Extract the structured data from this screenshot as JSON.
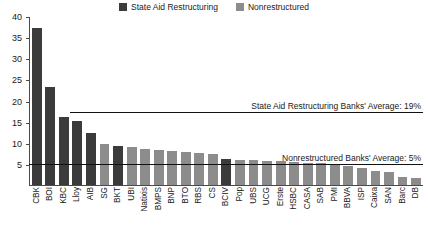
{
  "chart_data": {
    "type": "bar",
    "title": "",
    "xlabel": "",
    "ylabel": "",
    "ylim": [
      0,
      40
    ],
    "yticks": [
      0,
      5,
      10,
      15,
      20,
      25,
      30,
      35,
      40
    ],
    "ytick_labels": [
      "",
      "5",
      "10",
      "15",
      "20",
      "25",
      "30",
      "35",
      "40"
    ],
    "grid": false,
    "legend_position": "top-center",
    "categories": [
      "CBK",
      "BOI",
      "KBC",
      "Lloy",
      "AIB",
      "SG",
      "BKT",
      "UBI",
      "Natixis",
      "BMPS",
      "BNP",
      "BTO",
      "RBS",
      "CS",
      "BCIV",
      "Pop",
      "UBS",
      "UCG",
      "Erste",
      "HSBC",
      "CASA",
      "SAB",
      "PMI",
      "BBVA",
      "ISP",
      "Caixa",
      "SAN",
      "Barc",
      "DB"
    ],
    "values": [
      37.2,
      23.2,
      16.2,
      15.2,
      12.4,
      9.6,
      9.3,
      8.9,
      8.6,
      8.4,
      8.1,
      7.9,
      7.6,
      7.4,
      6.2,
      6.0,
      5.9,
      5.8,
      5.7,
      5.4,
      5.2,
      5.1,
      5.0,
      4.4,
      4.0,
      3.4,
      3.0,
      2.0,
      1.6
    ],
    "group_by_category": [
      "State Aid Restructuring",
      "State Aid Restructuring",
      "State Aid Restructuring",
      "State Aid Restructuring",
      "State Aid Restructuring",
      "Nonrestructured",
      "State Aid Restructuring",
      "Nonrestructured",
      "Nonrestructured",
      "Nonrestructured",
      "Nonrestructured",
      "Nonrestructured",
      "Nonrestructured",
      "Nonrestructured",
      "State Aid Restructuring",
      "Nonrestructured",
      "Nonrestructured",
      "Nonrestructured",
      "Nonrestructured",
      "Nonrestructured",
      "Nonrestructured",
      "Nonrestructured",
      "Nonrestructured",
      "Nonrestructured",
      "Nonrestructured",
      "Nonrestructured",
      "Nonrestructured",
      "Nonrestructured",
      "Nonrestructured"
    ],
    "series": [
      {
        "name": "State Aid Restructuring",
        "color": "#3b3b3b"
      },
      {
        "name": "Nonrestructured",
        "color": "#8c8c8c"
      }
    ],
    "annotations": [
      {
        "label": "State Aid Restructuring Banks' Average: 19%",
        "value": 17.6,
        "line_from_category": "Lloy"
      },
      {
        "label": "Nonrestructured Banks' Average: 5%",
        "value": 5.3,
        "line_from_category": "CBK"
      }
    ]
  },
  "legend": {
    "items": [
      {
        "label": "State Aid Restructuring",
        "color": "#3b3b3b"
      },
      {
        "label": "Nonrestructured",
        "color": "#8c8c8c"
      }
    ]
  }
}
